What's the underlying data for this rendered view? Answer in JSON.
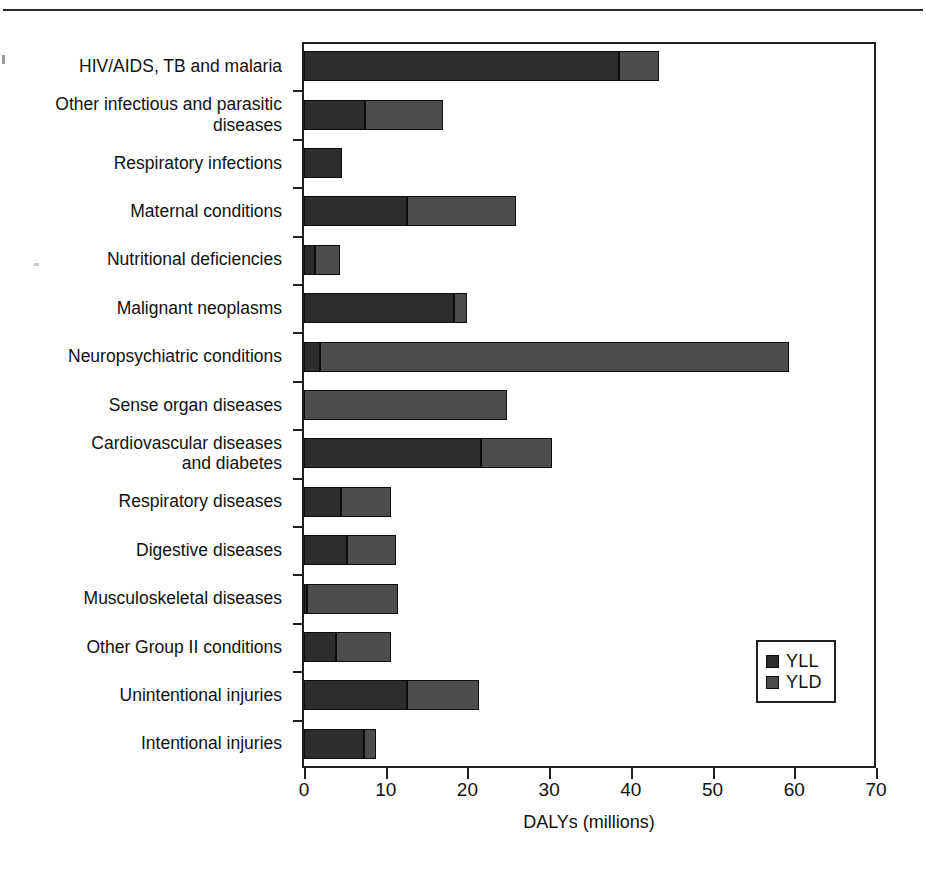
{
  "chart_data": {
    "type": "bar",
    "orientation": "horizontal",
    "stacked": true,
    "title": "",
    "xlabel": "DALYs (millions)",
    "ylabel": "",
    "xlim": [
      0,
      70
    ],
    "xticks": [
      0,
      10,
      20,
      30,
      40,
      50,
      60,
      70
    ],
    "xtick_labels": [
      "0",
      "10",
      "20",
      "30",
      "40",
      "50",
      "60",
      "70"
    ],
    "grid": false,
    "legend_position": "inside-bottom-right",
    "categories": [
      "HIV/AIDS, TB and malaria",
      "Other infectious and parasitic\ndiseases",
      "Respiratory infections",
      "Maternal conditions",
      "Nutritional deficiencies",
      "Malignant neoplasms",
      "Neuropsychiatric conditions",
      "Sense organ diseases",
      "Cardiovascular diseases\nand diabetes",
      "Respiratory diseases",
      "Digestive diseases",
      "Musculoskeletal diseases",
      "Other Group II conditions",
      "Unintentional injuries",
      "Intentional injuries"
    ],
    "series": [
      {
        "name": "YLL",
        "color": "#2d2d2d",
        "values": [
          38.5,
          7.5,
          4.6,
          12.6,
          1.4,
          18.3,
          2.0,
          0.0,
          21.7,
          4.5,
          5.3,
          0.4,
          3.9,
          12.6,
          7.3
        ]
      },
      {
        "name": "YLD",
        "color": "#4d4d4d",
        "values": [
          5.0,
          9.5,
          0.0,
          13.3,
          3.0,
          1.6,
          57.3,
          24.9,
          8.6,
          6.2,
          5.9,
          11.1,
          6.7,
          8.8,
          1.5
        ]
      }
    ],
    "totals": [
      43.5,
      17.0,
      4.6,
      25.9,
      4.4,
      19.9,
      59.3,
      24.9,
      30.3,
      10.7,
      11.2,
      11.5,
      10.6,
      21.4,
      8.8
    ]
  },
  "legend": {
    "items": [
      {
        "label": "YLL",
        "color": "#2d2d2d"
      },
      {
        "label": "YLD",
        "color": "#4d4d4d"
      }
    ]
  },
  "axis": {
    "title": "DALYs (millions)"
  },
  "colors": {
    "yll": "#2d2d2d",
    "yld": "#4d4d4d",
    "axis": "#1f1f1f",
    "background": "#ffffff"
  }
}
